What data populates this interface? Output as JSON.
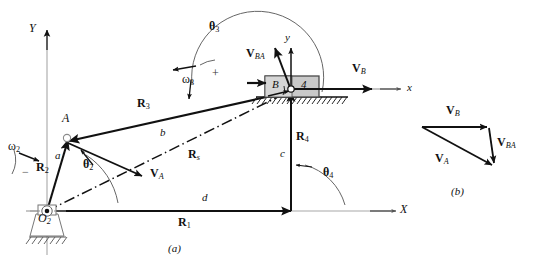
{
  "figure": {
    "panels": [
      {
        "id": "a",
        "caption": "(a)",
        "description": "Slider-crank linkage position vector loop with velocity vectors"
      },
      {
        "id": "b",
        "caption": "(b)",
        "description": "Velocity vector polygon"
      }
    ]
  },
  "colors": {
    "stroke": "#111111",
    "axis_gray": "#9a9a9a",
    "block_fill": "#c8c8c8",
    "block_fill_light": "#d8d8d8",
    "block_stroke": "#4a4a4a",
    "background": "#ffffff"
  },
  "panel_a": {
    "caption": "(a)",
    "global_axes": {
      "y_label": "Y",
      "x_label": "X"
    },
    "local_axes": {
      "y_label": "y",
      "x_label": "x"
    },
    "points": {
      "origin_label": "O",
      "origin_sub": "2",
      "joint_a_label": "A",
      "joint_b_label": "B",
      "slider_number": "4"
    },
    "vectors": [
      {
        "name": "R2",
        "label": "R",
        "sub": "2",
        "kind": "position"
      },
      {
        "name": "R3",
        "label": "R",
        "sub": "3",
        "kind": "position"
      },
      {
        "name": "R4",
        "label": "R",
        "sub": "4",
        "kind": "position"
      },
      {
        "name": "R1",
        "label": "R",
        "sub": "1",
        "kind": "position"
      },
      {
        "name": "Rs",
        "label": "R",
        "sub": "s",
        "kind": "position-dashdot"
      },
      {
        "name": "VA",
        "label": "V",
        "sub": "A",
        "kind": "velocity"
      },
      {
        "name": "VB",
        "label": "V",
        "sub": "B",
        "kind": "velocity"
      },
      {
        "name": "VBA",
        "label": "V",
        "sub": "BA",
        "kind": "velocity"
      }
    ],
    "lengths": [
      {
        "name": "a",
        "label": "a"
      },
      {
        "name": "b",
        "label": "b"
      },
      {
        "name": "c",
        "label": "c"
      },
      {
        "name": "d",
        "label": "d"
      }
    ],
    "angles": [
      {
        "name": "theta2",
        "label": "θ",
        "sub": "2"
      },
      {
        "name": "theta3",
        "label": "θ",
        "sub": "3"
      },
      {
        "name": "theta4",
        "label": "θ",
        "sub": "4"
      }
    ],
    "angular_velocities": [
      {
        "name": "omega2",
        "label": "ω",
        "sub": "2",
        "sign": "−"
      },
      {
        "name": "omega3",
        "label": "ω",
        "sub": "3",
        "sign": "+"
      }
    ]
  },
  "panel_b": {
    "caption": "(b)",
    "vectors": [
      {
        "name": "VB",
        "label": "V",
        "sub": "B"
      },
      {
        "name": "VBA",
        "label": "V",
        "sub": "BA"
      },
      {
        "name": "VA",
        "label": "V",
        "sub": "A"
      }
    ]
  }
}
